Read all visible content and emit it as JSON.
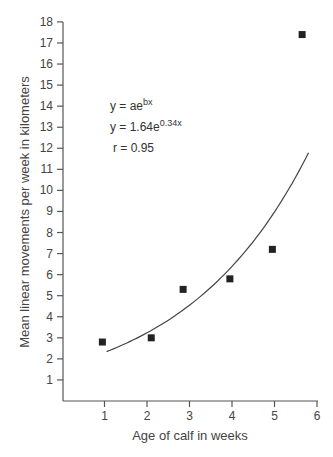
{
  "chart_data": {
    "type": "scatter",
    "title": "",
    "xlabel": "Age of calf in weeks",
    "ylabel": "Mean linear movements per week in kilometers",
    "xlim": [
      0,
      6
    ],
    "ylim": [
      0,
      18
    ],
    "xticks": [
      1,
      2,
      3,
      4,
      5,
      6
    ],
    "yticks": [
      1,
      2,
      3,
      4,
      5,
      6,
      7,
      8,
      9,
      10,
      11,
      12,
      13,
      14,
      15,
      16,
      17,
      18
    ],
    "grid": false,
    "legend": null,
    "series": [
      {
        "name": "observed",
        "marker": "square",
        "points": [
          {
            "x": 0.95,
            "y": 2.8
          },
          {
            "x": 2.1,
            "y": 3.0
          },
          {
            "x": 2.85,
            "y": 5.3
          },
          {
            "x": 3.95,
            "y": 5.8
          },
          {
            "x": 4.95,
            "y": 7.2
          },
          {
            "x": 5.65,
            "y": 17.4
          }
        ]
      },
      {
        "name": "fit",
        "type": "line",
        "model": "exponential",
        "a": 1.64,
        "b": 0.34,
        "x_range": [
          1.05,
          5.8
        ]
      }
    ],
    "annotations": {
      "line1": "y = ae",
      "line1_sup": "bx",
      "line2": "y = 1.64e",
      "line2_sup": "0.34x",
      "line3": "r = 0.95"
    }
  }
}
